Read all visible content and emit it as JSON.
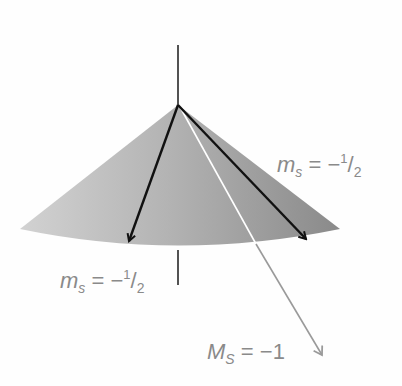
{
  "diagram": {
    "type": "spin-vector-cone",
    "colors": {
      "background": "#fefefe",
      "cone_light": "#c8c8c8",
      "cone_dark": "#8e8e8e",
      "axis": "#1a1a1a",
      "component_arrow": "#111111",
      "resultant_arrow_inside": "#ffffff",
      "resultant_arrow_outside": "#9a9a9a",
      "label": "#8a8a8a"
    },
    "labels": [
      {
        "id": "ms-right",
        "symbol": "m",
        "subscript": "s",
        "equals": "=",
        "sign": "−",
        "numerator": "1",
        "slash": "/",
        "denominator": "2"
      },
      {
        "id": "ms-left",
        "symbol": "m",
        "subscript": "s",
        "equals": "=",
        "sign": "−",
        "numerator": "1",
        "slash": "/",
        "denominator": "2"
      },
      {
        "id": "MS-total",
        "symbol": "M",
        "subscript": "S",
        "equals": "=",
        "value": "−1"
      }
    ]
  }
}
